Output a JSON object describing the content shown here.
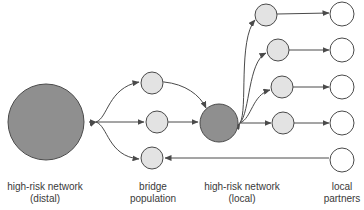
{
  "diagram": {
    "labels": {
      "distal": {
        "line1": "high-risk network",
        "line2": "(distal)"
      },
      "bridge": {
        "line1": "bridge",
        "line2": "population"
      },
      "local": {
        "line1": "high-risk network",
        "line2": "(local)"
      },
      "partners": {
        "line1": "local",
        "line2": "partners"
      }
    },
    "colors": {
      "dark_node": "#8f8f8f",
      "light_node": "#e3e3e3",
      "empty_node": "#ffffff",
      "stroke": "#4a4a4a",
      "text": "#3a3a3a"
    }
  }
}
